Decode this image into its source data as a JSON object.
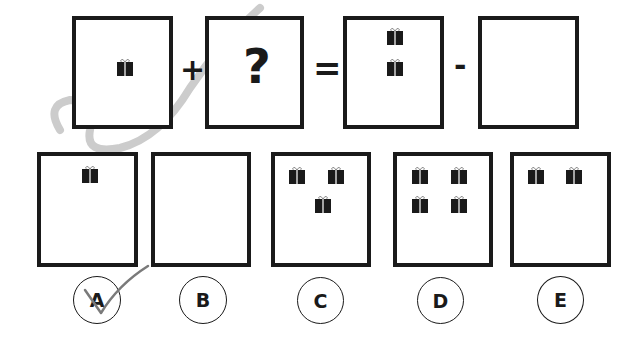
{
  "question": {
    "operand1_count": 1,
    "plus_symbol": "+",
    "unknown_symbol": "?",
    "equals_symbol": "=",
    "result_count": 2,
    "minus_symbol": "-",
    "subtrahend_count": 0
  },
  "options": [
    {
      "label": "A",
      "gift_count": 1,
      "checked": true
    },
    {
      "label": "B",
      "gift_count": 0,
      "checked": false
    },
    {
      "label": "C",
      "gift_count": 3,
      "checked": false
    },
    {
      "label": "D",
      "gift_count": 4,
      "checked": false
    },
    {
      "label": "E",
      "gift_count": 2,
      "checked": false
    }
  ],
  "icons": {
    "gift": "gift-icon",
    "check": "checkmark-icon"
  },
  "colors": {
    "ink": "#1a1a1a",
    "watermark": "#c8c8c8",
    "check": "#7a7a7a"
  }
}
